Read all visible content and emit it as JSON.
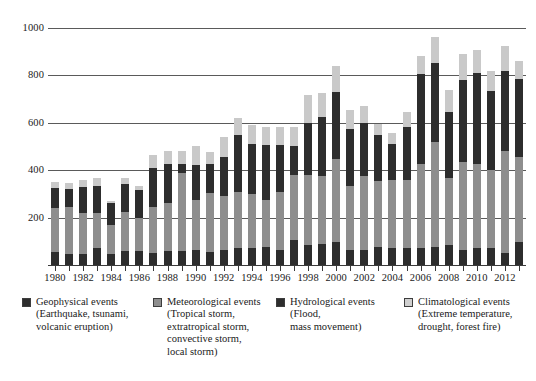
{
  "chart_data": {
    "type": "bar",
    "subtype": "stacked-bar",
    "title": "",
    "xlabel": "",
    "ylabel": "",
    "ylim": [
      0,
      1050
    ],
    "yticks": [
      200,
      400,
      600,
      800,
      1000
    ],
    "grid": true,
    "legend_position": "bottom",
    "xtick_step": 2,
    "categories": [
      "1980",
      "1981",
      "1982",
      "1983",
      "1984",
      "1985",
      "1986",
      "1987",
      "1988",
      "1989",
      "1990",
      "1991",
      "1992",
      "1993",
      "1994",
      "1995",
      "1996",
      "1997",
      "1998",
      "1999",
      "2000",
      "2001",
      "2002",
      "2003",
      "2004",
      "2005",
      "2006",
      "2007",
      "2008",
      "2009",
      "2010",
      "2011",
      "2012",
      "2013"
    ],
    "xtick_labels": [
      "1980",
      "1982",
      "1984",
      "1986",
      "1988",
      "1990",
      "1992",
      "1994",
      "1996",
      "1998",
      "2000",
      "2002",
      "2004",
      "2006",
      "2008",
      "2010",
      "2012"
    ],
    "series": [
      {
        "name": "Geophysical events",
        "color": "#2d2d2d",
        "values": [
          55,
          45,
          45,
          70,
          45,
          60,
          60,
          50,
          60,
          60,
          65,
          55,
          65,
          70,
          70,
          75,
          65,
          105,
          85,
          90,
          95,
          65,
          65,
          75,
          70,
          70,
          70,
          75,
          85,
          65,
          70,
          70,
          50,
          95
        ]
      },
      {
        "name": "Meteorological events",
        "color": "#8e8e8e",
        "values": [
          185,
          200,
          175,
          150,
          125,
          165,
          140,
          195,
          200,
          330,
          210,
          250,
          225,
          240,
          230,
          200,
          245,
          275,
          295,
          285,
          350,
          270,
          310,
          280,
          290,
          290,
          355,
          445,
          280,
          370,
          355,
          330,
          430,
          360
        ]
      },
      {
        "name": "Hydrological events",
        "color": "#2d2d2d",
        "values": [
          85,
          75,
          110,
          115,
          90,
          115,
          115,
          165,
          165,
          35,
          145,
          120,
          165,
          240,
          210,
          230,
          195,
          120,
          220,
          250,
          285,
          240,
          225,
          195,
          150,
          220,
          380,
          330,
          280,
          345,
          385,
          335,
          340,
          330
        ]
      },
      {
        "name": "Climatological events",
        "color": "#c9c9c9",
        "values": [
          25,
          25,
          30,
          30,
          10,
          25,
          20,
          55,
          55,
          55,
          80,
          50,
          85,
          70,
          80,
          75,
          75,
          80,
          115,
          100,
          110,
          80,
          70,
          45,
          45,
          65,
          75,
          110,
          95,
          110,
          95,
          85,
          105,
          75
        ]
      }
    ],
    "totals": [
      350,
      345,
      360,
      365,
      270,
      365,
      335,
      465,
      480,
      480,
      500,
      475,
      540,
      620,
      590,
      580,
      580,
      580,
      715,
      725,
      840,
      655,
      670,
      595,
      555,
      645,
      880,
      960,
      740,
      890,
      905,
      820,
      925,
      860
    ]
  },
  "legend": {
    "items": [
      {
        "name": "geophysical",
        "title": "Geophysical events",
        "sub_lines": [
          "(Earthquake, tsunami,",
          "volcanic eruption)"
        ],
        "color": "#2d2d2d"
      },
      {
        "name": "meteorological",
        "title": "Meteorological events",
        "sub_lines": [
          "(Tropical storm,",
          "extratropical storm,",
          "convective storm,",
          "local storm)"
        ],
        "color": "#8e8e8e"
      },
      {
        "name": "hydrological",
        "title": "Hydrological events",
        "sub_lines": [
          "(Flood,",
          "mass movement)"
        ],
        "color": "#2d2d2d"
      },
      {
        "name": "climatological",
        "title": "Climatological events",
        "sub_lines": [
          "(Extreme temperature,",
          "drought, forest fire)"
        ],
        "color": "#cfcfcf"
      }
    ]
  }
}
